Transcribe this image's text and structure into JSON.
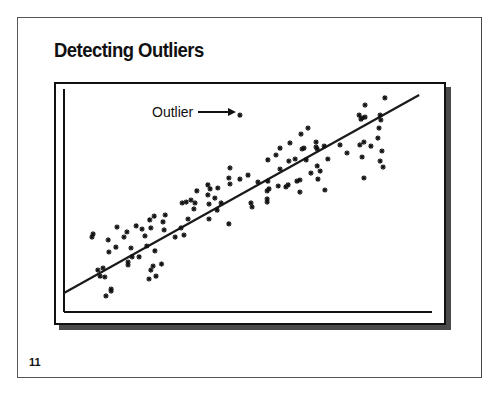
{
  "slide": {
    "title": "Detecting Outliers",
    "page_number": "11"
  },
  "chart_data": {
    "type": "scatter",
    "title": "Detecting Outliers",
    "xlabel": "",
    "ylabel": "",
    "xlim": [
      0,
      100
    ],
    "ylim": [
      0,
      100
    ],
    "grid": false,
    "legend": null,
    "marker": "asterisk",
    "annotations": [
      {
        "text": "Outlier",
        "arrow_to": [
          47.8,
          88.3
        ],
        "label_pos": [
          24.5,
          89.7
        ]
      }
    ],
    "regression_line": {
      "x": [
        0,
        96.5
      ],
      "y": [
        8.5,
        97.3
      ]
    },
    "outlier": {
      "x": 47.8,
      "y": 88.3
    },
    "points": [
      [
        7.6,
        33.6
      ],
      [
        7.9,
        35.0
      ],
      [
        9.2,
        18.8
      ],
      [
        9.8,
        16.1
      ],
      [
        10.6,
        19.7
      ],
      [
        11.1,
        15.7
      ],
      [
        11.4,
        7.2
      ],
      [
        12.0,
        32.3
      ],
      [
        12.2,
        26.9
      ],
      [
        12.8,
        10.3
      ],
      [
        12.8,
        9.4
      ],
      [
        14.1,
        29.1
      ],
      [
        14.4,
        38.1
      ],
      [
        16.3,
        33.6
      ],
      [
        17.1,
        35.9
      ],
      [
        17.4,
        22.4
      ],
      [
        17.4,
        21.1
      ],
      [
        18.2,
        28.7
      ],
      [
        18.5,
        24.7
      ],
      [
        19.6,
        38.6
      ],
      [
        22.5,
        29.6
      ],
      [
        24.2,
        20.6
      ],
      [
        25.0,
        16.1
      ],
      [
        26.5,
        21.5
      ],
      [
        24.7,
        27.4
      ],
      [
        27.2,
        36.8
      ],
      [
        20.4,
        24.7
      ],
      [
        23.3,
        41.3
      ],
      [
        22.0,
        34.1
      ],
      [
        23.1,
        14.8
      ],
      [
        23.6,
        18.8
      ],
      [
        21.2,
        37.2
      ],
      [
        23.6,
        37.7
      ],
      [
        24.5,
        43.0
      ],
      [
        26.9,
        40.4
      ],
      [
        27.5,
        43.5
      ],
      [
        30.2,
        33.6
      ],
      [
        32.1,
        48.9
      ],
      [
        33.2,
        49.3
      ],
      [
        32.6,
        34.5
      ],
      [
        31.8,
        37.7
      ],
      [
        33.7,
        41.7
      ],
      [
        34.5,
        50.2
      ],
      [
        35.3,
        46.2
      ],
      [
        35.6,
        48.9
      ],
      [
        39.4,
        48.4
      ],
      [
        39.4,
        41.7
      ],
      [
        39.1,
        52.5
      ],
      [
        39.7,
        55.2
      ],
      [
        41.6,
        45.7
      ],
      [
        42.7,
        48.9
      ],
      [
        44.8,
        39.5
      ],
      [
        36.1,
        54.3
      ],
      [
        39.1,
        57.0
      ],
      [
        41.0,
        51.1
      ],
      [
        44.8,
        60.1
      ],
      [
        45.1,
        57.4
      ],
      [
        41.8,
        55.6
      ],
      [
        45.1,
        64.6
      ],
      [
        47.8,
        59.6
      ],
      [
        50.8,
        48.9
      ],
      [
        51.1,
        47.1
      ],
      [
        50.0,
        61.4
      ],
      [
        52.7,
        58.3
      ],
      [
        55.2,
        49.3
      ],
      [
        55.4,
        58.7
      ],
      [
        55.7,
        55.2
      ],
      [
        58.2,
        56.5
      ],
      [
        55.2,
        54.3
      ],
      [
        58.7,
        64.1
      ],
      [
        55.2,
        50.7
      ],
      [
        55.4,
        68.2
      ],
      [
        57.6,
        70.4
      ],
      [
        58.7,
        73.5
      ],
      [
        60.3,
        56.1
      ],
      [
        61.4,
        75.8
      ],
      [
        62.8,
        68.6
      ],
      [
        63.3,
        58.7
      ],
      [
        64.1,
        53.8
      ],
      [
        64.7,
        73.1
      ],
      [
        65.8,
        68.2
      ],
      [
        64.1,
        59.2
      ],
      [
        66.3,
        82.5
      ],
      [
        64.4,
        79.8
      ],
      [
        65.2,
        73.5
      ],
      [
        61.1,
        67.7
      ],
      [
        60.9,
        57.0
      ],
      [
        67.1,
        62.3
      ],
      [
        68.8,
        73.1
      ],
      [
        68.5,
        74.0
      ],
      [
        68.5,
        76.2
      ],
      [
        69.6,
        63.2
      ],
      [
        68.8,
        65.5
      ],
      [
        69.0,
        59.6
      ],
      [
        70.9,
        54.7
      ],
      [
        70.7,
        74.4
      ],
      [
        71.7,
        68.6
      ],
      [
        75.0,
        74.9
      ],
      [
        76.9,
        71.3
      ],
      [
        80.2,
        88.3
      ],
      [
        80.7,
        86.5
      ],
      [
        81.0,
        87.0
      ],
      [
        81.8,
        92.8
      ],
      [
        80.4,
        74.9
      ],
      [
        85.9,
        88.3
      ],
      [
        81.0,
        69.5
      ],
      [
        81.5,
        76.2
      ],
      [
        87.2,
        96.0
      ],
      [
        81.8,
        87.4
      ],
      [
        86.1,
        86.1
      ],
      [
        81.5,
        60.1
      ],
      [
        85.6,
        82.5
      ],
      [
        85.3,
        78.0
      ],
      [
        83.4,
        74.4
      ],
      [
        86.4,
        72.2
      ],
      [
        85.9,
        67.7
      ],
      [
        86.7,
        65.0
      ]
    ]
  }
}
